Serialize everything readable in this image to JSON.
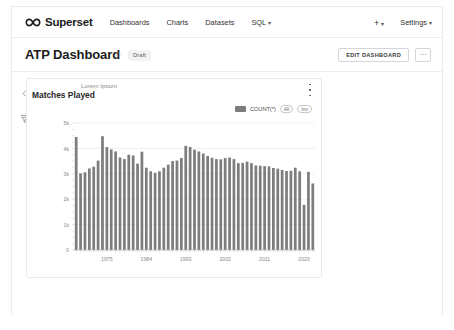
{
  "navbar": {
    "brand": "Superset",
    "brand_icon": "superset-infinity-logo",
    "links": [
      {
        "label": "Dashboards",
        "name": "dashboards"
      },
      {
        "label": "Charts",
        "name": "charts"
      },
      {
        "label": "Datasets",
        "name": "datasets"
      },
      {
        "label": "SQL",
        "name": "sql",
        "caret": "▾"
      }
    ],
    "plus_label": "+",
    "plus_caret": "▾",
    "settings_label": "Settings",
    "settings_caret": "▾"
  },
  "header": {
    "title": "ATP Dashboard",
    "star_icon": "☆",
    "badge": "Draft",
    "edit_button": "EDIT DASHBOARD",
    "more_button": "···"
  },
  "rail": {
    "collapse_icon": "collapse-left-icon",
    "filter_icon": "filter-icon"
  },
  "chart_card": {
    "subtitle": "Lorem Ipsum",
    "title": "Matches Played",
    "kebab": "more-options-icon",
    "legend": {
      "series_label": "COUNT(*)",
      "series_color": "#7d7d7d",
      "pill_all": "All",
      "pill_inv": "Inv"
    }
  },
  "chart_data": {
    "type": "bar",
    "title": "Matches Played",
    "subtitle": "Lorem Ipsum",
    "xlabel": "",
    "ylabel": "",
    "ylim": [
      0,
      5000
    ],
    "ytick_labels": [
      "0",
      "1k",
      "2k",
      "3k",
      "4k",
      "5k"
    ],
    "ytick_values": [
      0,
      1000,
      2000,
      3000,
      4000,
      5000
    ],
    "xtick_labels": [
      "1975",
      "1984",
      "1993",
      "2002",
      "2011",
      "2020"
    ],
    "xtick_values": [
      1975,
      1984,
      1993,
      2002,
      2011,
      2020
    ],
    "grid": true,
    "legend_position": "top-right",
    "series": [
      {
        "name": "COUNT(*)",
        "color": "#7d7d7d",
        "categories": [
          1968,
          1969,
          1970,
          1971,
          1972,
          1973,
          1974,
          1975,
          1976,
          1977,
          1978,
          1979,
          1980,
          1981,
          1982,
          1983,
          1984,
          1985,
          1986,
          1987,
          1988,
          1989,
          1990,
          1991,
          1992,
          1993,
          1994,
          1995,
          1996,
          1997,
          1998,
          1999,
          2000,
          2001,
          2002,
          2003,
          2004,
          2005,
          2006,
          2007,
          2008,
          2009,
          2010,
          2011,
          2012,
          2013,
          2014,
          2015,
          2016,
          2017,
          2018,
          2019,
          2020,
          2021,
          2022
        ],
        "values": [
          4450,
          3020,
          3060,
          3210,
          3280,
          3520,
          4480,
          4050,
          3960,
          3880,
          3640,
          3580,
          3750,
          3720,
          3400,
          3870,
          3240,
          3100,
          3040,
          3100,
          3240,
          3360,
          3500,
          3520,
          3620,
          4100,
          4060,
          3950,
          3880,
          3800,
          3700,
          3630,
          3580,
          3570,
          3620,
          3640,
          3580,
          3420,
          3430,
          3480,
          3420,
          3330,
          3320,
          3300,
          3290,
          3230,
          3200,
          3150,
          3110,
          3120,
          3240,
          3100,
          1780,
          3080,
          2620
        ]
      }
    ]
  }
}
